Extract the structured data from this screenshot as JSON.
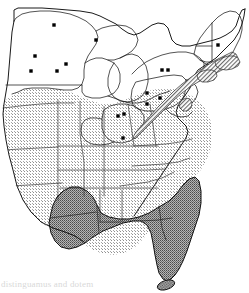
{
  "figure": {
    "type": "range-map",
    "region": "Eastern North America",
    "caption_fragment": "distinguamus and dotem",
    "width": 249,
    "height": 293
  },
  "legend": {
    "zones": [
      {
        "id": "absent",
        "label": "Unshaded (outside shaded range)",
        "fill": "#ffffff",
        "pattern": "none"
      },
      {
        "id": "light-range",
        "label": "Light stipple range",
        "fill": "#d3d3d3",
        "pattern": "fine-dot-stipple"
      },
      {
        "id": "dark-range",
        "label": "Dark stipple range",
        "fill": "#8a8a8a",
        "pattern": "coarse-dot-stipple"
      },
      {
        "id": "hatched-coast",
        "label": "Hatched coastal band",
        "fill": "#a8a8a8",
        "pattern": "diagonal-hatch"
      }
    ],
    "symbols": [
      {
        "id": "record-dot",
        "label": "Occurrence record",
        "color": "#000000",
        "shape": "square-dot"
      }
    ]
  },
  "map": {
    "outline_color": "#000000",
    "border_color": "#000000",
    "background": "#ffffff",
    "state_boundary_color": "#1a1a1a"
  },
  "chart_data": {
    "type": "map",
    "xlabel": "",
    "ylabel": "",
    "zones": [
      {
        "name": "light-stipple-range",
        "shading": "light",
        "approx_states": [
          "Nebraska",
          "Kansas",
          "Iowa",
          "Missouri",
          "Illinois",
          "Indiana",
          "Kentucky",
          "Tennessee",
          "Arkansas",
          "Oklahoma",
          "West Virginia",
          "Virginia",
          "North Carolina",
          "South Carolina",
          "Maryland",
          "Delaware",
          "Mississippi",
          "Alabama",
          "Georgia"
        ]
      },
      {
        "name": "dark-stipple-range",
        "shading": "dark",
        "approx_states": [
          "Louisiana",
          "Coastal Mississippi",
          "Coastal Alabama",
          "Florida",
          "South Georgia"
        ]
      },
      {
        "name": "unshaded-north",
        "shading": "none",
        "approx_states": [
          "Minnesota",
          "Wisconsin",
          "Michigan",
          "Ohio",
          "Pennsylvania",
          "New York",
          "Vermont",
          "New Hampshire",
          "Maine",
          "Massachusetts",
          "Connecticut",
          "New Jersey"
        ]
      }
    ],
    "record_points": [
      {
        "label": "Minnesota north",
        "x": 54,
        "y": 25
      },
      {
        "label": "Minnesota central",
        "x": 35,
        "y": 56
      },
      {
        "label": "Minnesota south",
        "x": 31,
        "y": 71
      },
      {
        "label": "Wisconsin central",
        "x": 66,
        "y": 64
      },
      {
        "label": "Upper Michigan",
        "x": 96,
        "y": 40
      },
      {
        "label": "Lower Michigan",
        "x": 57,
        "y": 71
      },
      {
        "label": "Ohio northwest",
        "x": 118,
        "y": 116
      },
      {
        "label": "Ohio north",
        "x": 124,
        "y": 114
      },
      {
        "label": "Ohio south",
        "x": 123,
        "y": 138
      },
      {
        "label": "Pennsylvania west",
        "x": 147,
        "y": 93
      },
      {
        "label": "Pennsylvania east",
        "x": 160,
        "y": 98
      },
      {
        "label": "Pennsylvania northeast",
        "x": 147,
        "y": 104
      },
      {
        "label": "New York west",
        "x": 162,
        "y": 70
      },
      {
        "label": "New York central",
        "x": 168,
        "y": 70
      },
      {
        "label": "New Hampshire",
        "x": 218,
        "y": 45
      }
    ]
  }
}
